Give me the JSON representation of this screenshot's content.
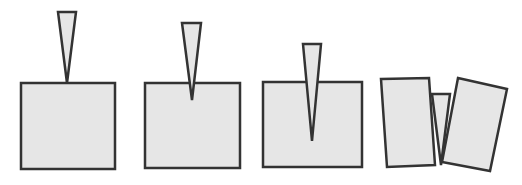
{
  "diagram": {
    "colors": {
      "fill": "#e6e6e6",
      "stroke": "#333333",
      "background": "#ffffff"
    },
    "stages": [
      {
        "name": "stage-1-wedge-touching",
        "wedge": "58,12 76,12 67,83",
        "block": "21,83 115,83 115,169 21,169"
      },
      {
        "name": "stage-2-wedge-entering",
        "wedge": "182,23 201,23 192,100",
        "block": "145,83 240,83 240,168 145,168"
      },
      {
        "name": "stage-3-wedge-deep",
        "wedge": "303,44 321,44 312,141",
        "block": "263,82 362,82 362,167 263,167"
      },
      {
        "name": "stage-4-block-split",
        "left_piece": "381,79 429,78 435,165 387,167",
        "wedge": "432,94 450,94 441,165",
        "right_piece": "458,78 507,89 490,171 442,162"
      }
    ]
  }
}
